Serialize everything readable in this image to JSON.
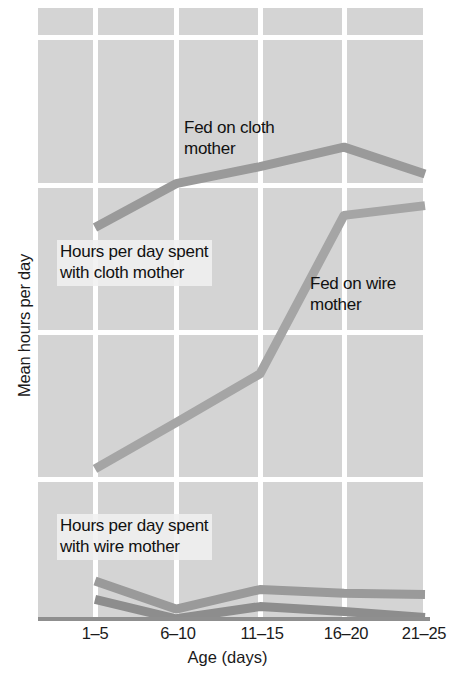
{
  "chart_data": {
    "type": "line",
    "title": "",
    "xlabel": "Age (days)",
    "ylabel": "Mean hours per day",
    "categories": [
      "1–5",
      "6–10",
      "11–15",
      "16–20",
      "21–25"
    ],
    "ylim": [
      0,
      24
    ],
    "yticks": [
      6,
      12,
      18,
      24
    ],
    "ytick_labels": [
      "6",
      "12",
      "18",
      "24"
    ],
    "grid": true,
    "legend_position": "inline-annotations",
    "series": [
      {
        "name": "Hours per day spent with cloth mother — fed on cloth mother",
        "values": [
          16.1,
          17.9,
          18.6,
          19.4,
          18.3
        ],
        "color": "#9a9a9a"
      },
      {
        "name": "Hours per day spent with cloth mother — fed on wire mother",
        "values": [
          6.2,
          8.1,
          10.1,
          16.6,
          17.0
        ],
        "color": "#a5a5a5"
      },
      {
        "name": "Hours per day spent with wire mother — fed on wire mother",
        "values": [
          1.6,
          0.45,
          1.25,
          1.1,
          1.05
        ],
        "color": "#9a9a9a"
      },
      {
        "name": "Hours per day spent with wire mother — fed on cloth mother",
        "values": [
          0.85,
          0.05,
          0.55,
          0.35,
          0.1
        ],
        "color": "#8d8d8d"
      }
    ],
    "annotations": [
      {
        "id": "fed-on-cloth-mother",
        "text": "Fed on cloth\nmother",
        "boxed": false
      },
      {
        "id": "hours-with-cloth-mother",
        "text": "Hours per day spent\nwith cloth mother",
        "boxed": true
      },
      {
        "id": "fed-on-wire-mother",
        "text": "Fed on wire\nmother",
        "boxed": false
      },
      {
        "id": "hours-with-wire-mother",
        "text": "Hours per day spent\nwith wire mother",
        "boxed": true
      }
    ],
    "colors": {
      "panel_background": "#d4d4d4",
      "gridline": "#ffffff",
      "axis": "#8f8f8f",
      "text": "#1a1a1a"
    }
  }
}
